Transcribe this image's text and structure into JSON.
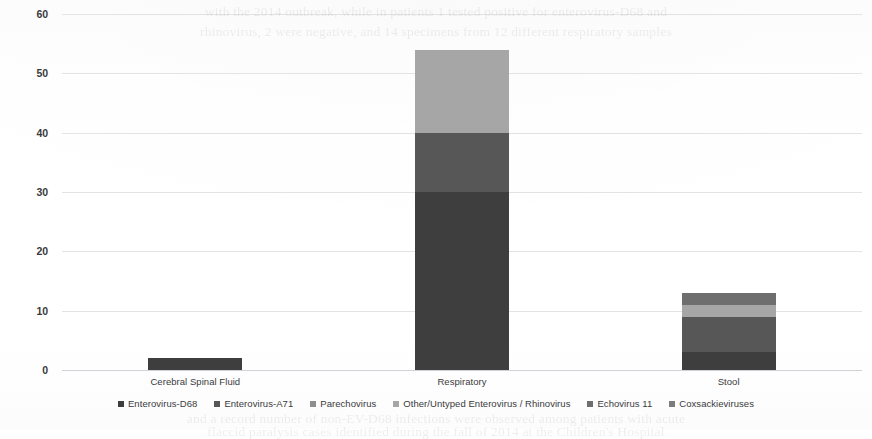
{
  "chart_data": {
    "type": "bar",
    "subtype": "stacked-bar",
    "title": "",
    "xlabel": "",
    "ylabel": "",
    "ylim": [
      0,
      60
    ],
    "ytick_step": 10,
    "yticks": [
      "0",
      "10",
      "20",
      "30",
      "40",
      "50",
      "60"
    ],
    "grid": true,
    "legend_position": "bottom",
    "categories": [
      "Cerebral Spinal Fluid",
      "Respiratory",
      "Stool"
    ],
    "series": [
      {
        "name": "Enterovirus-D68",
        "color": "#3E3E3E",
        "values": [
          2,
          30,
          3
        ]
      },
      {
        "name": "Enterovirus-A71",
        "color": "#575757",
        "values": [
          0,
          10,
          6
        ]
      },
      {
        "name": "Parechovirus",
        "color": "#8E8E8E",
        "values": [
          0,
          0,
          0
        ]
      },
      {
        "name": "Other/Untyped Enterovirus / Rhinovirus",
        "color": "#A6A6A6",
        "values": [
          0,
          14,
          2
        ]
      },
      {
        "name": "Echovirus 11",
        "color": "#6E6E6E",
        "values": [
          0,
          0,
          2
        ]
      },
      {
        "name": "Coxsackieviruses",
        "color": "#7C7C7C",
        "values": [
          0,
          0,
          0
        ]
      }
    ],
    "totals": [
      2,
      54,
      13
    ]
  },
  "scan": {
    "bleed_lines": [
      "with the 2014 outbreak, while in patients 1 tested positive for enterovirus-D68 and",
      "rhinovirus, 2 were negative, and 14 specimens from 12 different respiratory samples"
    ],
    "bleed_lines_bottom": [
      "and a record number of non-EV-D68 infections were observed among patients with acute",
      "flaccid paralysis cases identified during the fall of 2014 at the Children's Hospital"
    ]
  }
}
